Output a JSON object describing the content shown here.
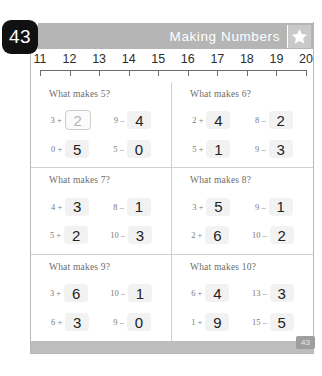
{
  "page": {
    "number_badge": "43",
    "footer_badge": "43",
    "banner_title": "Making Numbers",
    "star_icon": "star-icon",
    "banner_color": "#b5b5b5",
    "badge_color": "#111111"
  },
  "number_line": {
    "ticks": [
      "11",
      "12",
      "13",
      "14",
      "15",
      "16",
      "17",
      "18",
      "19",
      "20"
    ]
  },
  "problems": [
    {
      "title": "What makes 5?",
      "equations": [
        {
          "left": "3 +",
          "answer": "2",
          "hint": true
        },
        {
          "left": "9 –",
          "answer": "4",
          "hint": false
        },
        {
          "left": "0 +",
          "answer": "5",
          "hint": false
        },
        {
          "left": "5 –",
          "answer": "0",
          "hint": false
        }
      ]
    },
    {
      "title": "What makes 6?",
      "equations": [
        {
          "left": "2 +",
          "answer": "4",
          "hint": false
        },
        {
          "left": "8 –",
          "answer": "2",
          "hint": false
        },
        {
          "left": "5 +",
          "answer": "1",
          "hint": false
        },
        {
          "left": "9 –",
          "answer": "3",
          "hint": false
        }
      ]
    },
    {
      "title": "What makes 7?",
      "equations": [
        {
          "left": "4 +",
          "answer": "3",
          "hint": false
        },
        {
          "left": "8 –",
          "answer": "1",
          "hint": false
        },
        {
          "left": "5 +",
          "answer": "2",
          "hint": false
        },
        {
          "left": "10 –",
          "answer": "3",
          "hint": false
        }
      ]
    },
    {
      "title": "What makes 8?",
      "equations": [
        {
          "left": "3 +",
          "answer": "5",
          "hint": false
        },
        {
          "left": "9 –",
          "answer": "1",
          "hint": false
        },
        {
          "left": "2 +",
          "answer": "6",
          "hint": false
        },
        {
          "left": "10 –",
          "answer": "2",
          "hint": false
        }
      ]
    },
    {
      "title": "What makes 9?",
      "equations": [
        {
          "left": "3 +",
          "answer": "6",
          "hint": false
        },
        {
          "left": "10 –",
          "answer": "1",
          "hint": false
        },
        {
          "left": "6 +",
          "answer": "3",
          "hint": false
        },
        {
          "left": "9 –",
          "answer": "0",
          "hint": false
        }
      ]
    },
    {
      "title": "What makes 10?",
      "equations": [
        {
          "left": "6 +",
          "answer": "4",
          "hint": false
        },
        {
          "left": "13 –",
          "answer": "3",
          "hint": false
        },
        {
          "left": "1 +",
          "answer": "9",
          "hint": false
        },
        {
          "left": "15 –",
          "answer": "5",
          "hint": false
        }
      ]
    }
  ]
}
